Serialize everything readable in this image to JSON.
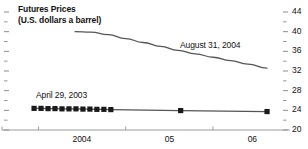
{
  "chart_data": {
    "type": "line",
    "title": "Futures Prices",
    "subtitle": "(U.S. dollars a barrel)",
    "xlabel": "",
    "ylabel": "",
    "ylim": [
      20,
      44
    ],
    "y_ticks": [
      44,
      40,
      36,
      32,
      28,
      24,
      20
    ],
    "y_minor_ticks": [
      42,
      38,
      34,
      30,
      26,
      22
    ],
    "y_axis_position": "right",
    "x_ticks": [
      "2004",
      "05",
      "06"
    ],
    "grid": false,
    "legend": null,
    "annotations": [
      {
        "text": "August 31, 2004",
        "series": "August 31, 2004"
      },
      {
        "text": "April 29, 2003",
        "series": "April 29, 2003"
      }
    ],
    "series": [
      {
        "name": "August 31, 2004",
        "markers": false,
        "x": [
          2004.42,
          2004.6,
          2004.8,
          2005.0,
          2005.2,
          2005.4,
          2005.6,
          2005.8,
          2006.0,
          2006.2,
          2006.4,
          2006.62
        ],
        "values": [
          40.0,
          39.9,
          39.4,
          38.6,
          37.8,
          37.0,
          36.2,
          35.5,
          34.8,
          34.1,
          33.4,
          32.6
        ]
      },
      {
        "name": "April 29, 2003",
        "markers": true,
        "x": [
          2003.95,
          2004.03,
          2004.11,
          2004.19,
          2004.27,
          2004.35,
          2004.43,
          2004.51,
          2004.59,
          2004.67,
          2004.75,
          2004.83,
          2005.63,
          2006.62
        ],
        "values": [
          24.4,
          24.4,
          24.35,
          24.35,
          24.3,
          24.3,
          24.3,
          24.25,
          24.25,
          24.2,
          24.2,
          24.15,
          23.95,
          23.75
        ]
      }
    ]
  },
  "axis": {
    "y_labels": [
      "44",
      "40",
      "36",
      "32",
      "28",
      "24",
      "20"
    ],
    "x_labels": [
      "2004",
      "05",
      "06"
    ]
  },
  "title": {
    "line1": "Futures Prices",
    "line2": "(U.S. dollars a barrel)"
  },
  "annotations": {
    "upper": "August 31, 2004",
    "lower": "April 29, 2003"
  }
}
